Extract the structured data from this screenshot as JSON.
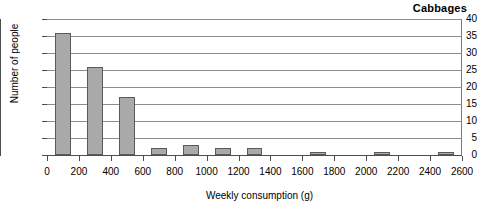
{
  "chart_data": {
    "type": "bar",
    "title": "Cabbages",
    "xlabel": "Weekly consumption (g)",
    "ylabel": "Number of people",
    "grid": true,
    "legend": false,
    "xlim": [
      0,
      2600
    ],
    "ylim": [
      0,
      40
    ],
    "xtick_labels": [
      "0",
      "200",
      "400",
      "600",
      "800",
      "1000",
      "1200",
      "1400",
      "1600",
      "1800",
      "2000",
      "2200",
      "2400",
      "2600"
    ],
    "xticks": [
      0,
      200,
      400,
      600,
      800,
      1000,
      1200,
      1400,
      1600,
      1800,
      2000,
      2200,
      2400,
      2600
    ],
    "ytick_labels": [
      "0",
      "5",
      "10",
      "15",
      "20",
      "25",
      "30",
      "35",
      "40"
    ],
    "yticks": [
      0,
      5,
      10,
      15,
      20,
      25,
      30,
      35,
      40
    ],
    "bar_width": 100,
    "categories": [
      100,
      300,
      500,
      700,
      900,
      1100,
      1300,
      1500,
      1700,
      1900,
      2100,
      2300,
      2500
    ],
    "values": [
      36,
      26,
      17,
      2,
      3,
      2,
      2,
      0,
      1,
      0,
      1,
      0,
      1
    ],
    "bar_color": "#a9a9a9",
    "bar_edge_color": "#5a5a5a",
    "grid_color": "#8d8d8d",
    "axis_color": "#4d4d4d"
  }
}
